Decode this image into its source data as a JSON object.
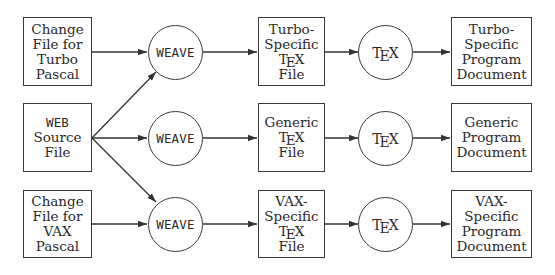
{
  "diagram": {
    "title": "",
    "sources": {
      "turbo_change": [
        "Change",
        "File for",
        "Turbo",
        "Pascal"
      ],
      "web_source": {
        "mono": "WEB",
        "rest": [
          "Source",
          "File"
        ]
      },
      "vax_change": [
        "Change",
        "File for",
        "VAX",
        "Pascal"
      ]
    },
    "weave": {
      "label": "WEAVE",
      "nodes": [
        "WEAVE",
        "WEAVE",
        "WEAVE"
      ]
    },
    "tex_files": {
      "turbo": {
        "lines_before": [
          "Turbo-",
          "Specific"
        ],
        "tex": "TEX",
        "lines_after": [
          "File"
        ]
      },
      "generic": {
        "lines_before": [
          "Generic"
        ],
        "tex": "TEX",
        "lines_after": [
          "File"
        ]
      },
      "vax": {
        "lines_before": [
          "VAX-",
          "Specific"
        ],
        "tex": "TEX",
        "lines_after": [
          "File"
        ]
      }
    },
    "tex_processor": {
      "t": "T",
      "e": "E",
      "x": "X"
    },
    "documents": {
      "turbo": [
        "Turbo-",
        "Specific",
        "Program",
        "Document"
      ],
      "generic": [
        "Generic",
        "Program",
        "Document"
      ],
      "vax": [
        "VAX-",
        "Specific",
        "Program",
        "Document"
      ]
    },
    "edges": [
      {
        "from": "Change File for Turbo Pascal",
        "to": "WEAVE (top)"
      },
      {
        "from": "WEB Source File",
        "to": "WEAVE (top)"
      },
      {
        "from": "WEB Source File",
        "to": "WEAVE (middle)"
      },
      {
        "from": "WEB Source File",
        "to": "WEAVE (bottom)"
      },
      {
        "from": "Change File for VAX Pascal",
        "to": "WEAVE (bottom)"
      },
      {
        "from": "WEAVE (top)",
        "to": "Turbo-Specific TeX File"
      },
      {
        "from": "WEAVE (middle)",
        "to": "Generic TeX File"
      },
      {
        "from": "WEAVE (bottom)",
        "to": "VAX-Specific TeX File"
      },
      {
        "from": "Turbo-Specific TeX File",
        "to": "TeX (top)"
      },
      {
        "from": "Generic TeX File",
        "to": "TeX (middle)"
      },
      {
        "from": "VAX-Specific TeX File",
        "to": "TeX (bottom)"
      },
      {
        "from": "TeX (top)",
        "to": "Turbo-Specific Program Document"
      },
      {
        "from": "TeX (middle)",
        "to": "Generic Program Document"
      },
      {
        "from": "TeX (bottom)",
        "to": "VAX-Specific Program Document"
      }
    ]
  }
}
